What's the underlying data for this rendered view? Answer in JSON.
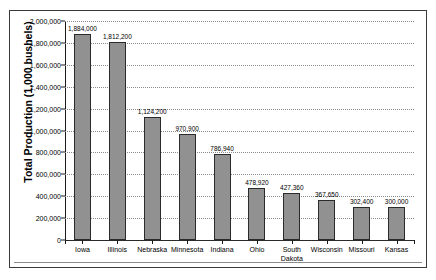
{
  "chart_data": {
    "type": "bar",
    "title": "",
    "xlabel": "",
    "ylabel": "Total Production (1,000 bushels)",
    "categories": [
      "Iowa",
      "Illinois",
      "Nebraska",
      "Minnesota",
      "Indiana",
      "Ohio",
      "South\nDakota",
      "Wisconsin",
      "Missouri",
      "Kansas"
    ],
    "values": [
      1884000,
      1812200,
      1124200,
      970900,
      786940,
      478920,
      427360,
      367650,
      302400,
      300000
    ],
    "value_labels": [
      "1,884,000",
      "1,812,200",
      "1,124,200",
      "970,900",
      "786,940",
      "478,920",
      "427,360",
      "367,650",
      "302,400",
      "300,000"
    ],
    "ylim": [
      0,
      2000000
    ],
    "ytick_values": [
      0,
      200000,
      400000,
      600000,
      800000,
      1000000,
      1200000,
      1400000,
      1600000,
      1800000,
      2000000
    ],
    "ytick_labels": [
      "0",
      "200,000",
      "400,000",
      "600,000",
      "800,000",
      "1,000,000",
      "1,200,000",
      "1,400,000",
      "1,600,000",
      "1,800,000",
      "2,000,000"
    ],
    "grid": true,
    "grid_style": "dotted",
    "legend": false,
    "bar_color": "#919191",
    "bar_border_color": "#2b2b2b",
    "axis_color": "#1a1a1a",
    "background": "#ffffff"
  }
}
